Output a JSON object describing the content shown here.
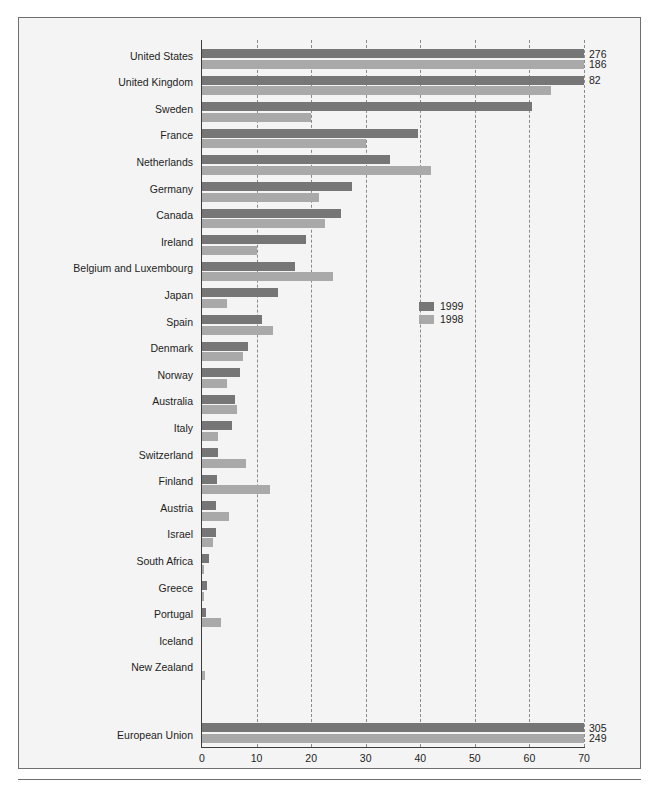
{
  "chart_data": {
    "type": "bar",
    "orientation": "horizontal",
    "title": "",
    "subtitle": "",
    "xlabel": "",
    "ylabel": "",
    "xlim": [
      0,
      70
    ],
    "xticks": [
      0,
      10,
      20,
      30,
      40,
      50,
      60,
      70
    ],
    "xtick_labels": [
      "0",
      "10",
      "20",
      "30",
      "40",
      "50",
      "60",
      "70"
    ],
    "grid": true,
    "grid_axis": "x",
    "grid_style": "dashed",
    "legend": {
      "position": "middle-right-inside",
      "entries": [
        {
          "name": "1999",
          "color": "#767676"
        },
        {
          "name": "1998",
          "color": "#a9a9a9"
        }
      ]
    },
    "categories": [
      "United States",
      "United Kingdom",
      "Sweden",
      "France",
      "Netherlands",
      "Germany",
      "Canada",
      "Ireland",
      "Belgium and Luxembourg",
      "Japan",
      "Spain",
      "Denmark",
      "Norway",
      "Australia",
      "Italy",
      "Switzerland",
      "Finland",
      "Austria",
      "Israel",
      "South Africa",
      "Greece",
      "Portugal",
      "Iceland",
      "New Zealand"
    ],
    "series": [
      {
        "name": "1999",
        "color": "#767676",
        "values": [
          276,
          82,
          60.5,
          39.5,
          34.5,
          27.5,
          25.5,
          19,
          17,
          14,
          11,
          8.5,
          7,
          6,
          5.5,
          3,
          2.8,
          2.5,
          2.5,
          1.2,
          1,
          0.8,
          0,
          0
        ]
      },
      {
        "name": "1998",
        "color": "#a9a9a9",
        "values": [
          186,
          64,
          20,
          30,
          42,
          21.5,
          22.5,
          10,
          24,
          4.5,
          13,
          7.5,
          4.5,
          6.5,
          3,
          8,
          12.5,
          5,
          2,
          0.3,
          0.3,
          3.5,
          0,
          0.5
        ]
      }
    ],
    "overflow_labels": [
      {
        "category": "United States",
        "series": "1999",
        "label": "276"
      },
      {
        "category": "United States",
        "series": "1998",
        "label": "186"
      },
      {
        "category": "United Kingdom",
        "series": "1999",
        "label": "82"
      }
    ],
    "aggregate_row": {
      "category": "European Union",
      "values": [
        {
          "series": "1999",
          "value": 305,
          "label": "305"
        },
        {
          "series": "1998",
          "value": 249,
          "label": "249"
        }
      ]
    }
  }
}
